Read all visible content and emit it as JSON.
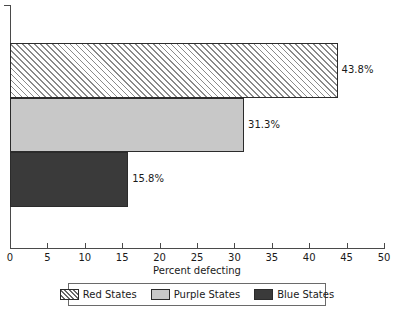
{
  "chart_data": {
    "type": "bar",
    "orientation": "horizontal",
    "title": "",
    "subtitle": "",
    "xlabel": "Percent defecting",
    "ylabel": "",
    "xlim": [
      0,
      50
    ],
    "ylim": null,
    "grid": false,
    "xticks": [
      0,
      5,
      10,
      15,
      20,
      25,
      30,
      35,
      40,
      45,
      50
    ],
    "xtick_labels": [
      "0",
      "5",
      "10",
      "15",
      "20",
      "25",
      "30",
      "35",
      "40",
      "45",
      "50"
    ],
    "categories": [
      "Red States",
      "Purple States",
      "Blue States"
    ],
    "values": [
      43.8,
      31.3,
      15.8
    ],
    "data_labels": [
      "43.8%",
      "31.3%",
      "15.8%"
    ],
    "bars": [
      {
        "category": "Red States",
        "value": 43.8,
        "label": "43.8%",
        "pattern": "pattern-hatch",
        "fill": "#ffffff",
        "hatch_color": "#8a8a8a",
        "edge": "#2b2b2b"
      },
      {
        "category": "Purple States",
        "value": 31.3,
        "label": "31.3%",
        "pattern": "pattern-solid-light",
        "fill": "#c8c8c8",
        "hatch_color": "",
        "edge": "#2b2b2b"
      },
      {
        "category": "Blue States",
        "value": 15.8,
        "label": "15.8%",
        "pattern": "pattern-solid-dark",
        "fill": "#3a3a3a",
        "hatch_color": "",
        "edge": "#2b2b2b"
      }
    ],
    "legend": {
      "position": "bottom",
      "boxed": true,
      "entries": [
        {
          "label": "Red States",
          "pattern": "pattern-hatch"
        },
        {
          "label": "Purple States",
          "pattern": "pattern-solid-light"
        },
        {
          "label": "Blue States",
          "pattern": "pattern-solid-dark"
        }
      ]
    },
    "colors": {
      "axis": "#4a4a4a",
      "text": "#1a1a1a",
      "background": "#ffffff",
      "bar_edge": "#2b2b2b"
    }
  }
}
